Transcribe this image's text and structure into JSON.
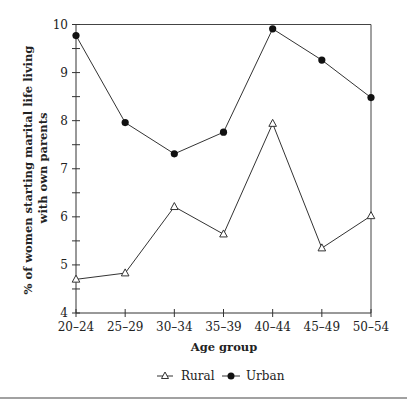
{
  "chart_data": {
    "type": "line",
    "title": "",
    "xlabel": "Age group",
    "ylabel": "% of women starting marital life living with own parents",
    "ylabel_lines": [
      "% of women starting marital life living",
      "with own parents"
    ],
    "categories": [
      "20–24",
      "25–29",
      "30–34",
      "35–39",
      "40–44",
      "45–49",
      "50–54"
    ],
    "ylim": [
      4,
      10
    ],
    "yticks": [
      4,
      5,
      6,
      7,
      8,
      9,
      10
    ],
    "grid": false,
    "legend_position": "bottom",
    "series": [
      {
        "name": "Rural",
        "marker": "open-triangle",
        "values": [
          4.7,
          4.83,
          6.21,
          5.64,
          7.94,
          5.35,
          6.02
        ]
      },
      {
        "name": "Urban",
        "marker": "filled-circle",
        "values": [
          9.77,
          7.96,
          7.31,
          7.76,
          9.91,
          9.26,
          8.48
        ]
      }
    ]
  },
  "legend": {
    "rural_label": "Rural",
    "urban_label": "Urban"
  },
  "colors": {
    "line": "#333333",
    "marker_fill_urban": "#111111",
    "marker_fill_rural": "#ffffff"
  }
}
